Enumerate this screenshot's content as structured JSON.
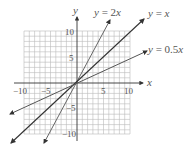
{
  "diagram": {
    "type": "coordinate-plane-linear-functions",
    "axes": {
      "x_label": "x",
      "y_label": "y",
      "x_range": [
        -10,
        10
      ],
      "y_range": [
        -10,
        10
      ],
      "grid": true,
      "grid_step": 1
    },
    "x_ticks": [
      {
        "value": -10,
        "label": "−10"
      },
      {
        "value": -5,
        "label": "−5"
      },
      {
        "value": 5,
        "label": "5"
      },
      {
        "value": 10,
        "label": "10"
      }
    ],
    "y_ticks": [
      {
        "value": 10,
        "label": "10"
      },
      {
        "value": 5,
        "label": "5"
      },
      {
        "value": -5,
        "label": "−5"
      },
      {
        "value": -10,
        "label": "−10"
      }
    ],
    "lines": [
      {
        "name": "y = 2x",
        "slope": 2,
        "color": "#666666"
      },
      {
        "name": "y = x",
        "slope": 1,
        "color": "#333333"
      },
      {
        "name": "y = 0.5x",
        "slope": 0.5,
        "color": "#555555"
      }
    ],
    "labels": {
      "line_2x": {
        "lhs": "y",
        "eq": " = 2",
        "var": "x"
      },
      "line_x": {
        "lhs": "y",
        "eq": " = ",
        "var": "x"
      },
      "line_half": {
        "lhs": "y",
        "eq": " = 0.5",
        "var": "x"
      }
    }
  }
}
